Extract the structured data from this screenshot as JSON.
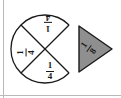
{
  "figure": {
    "background_color": "#ffffff",
    "stroke_color": "#1a1a1a",
    "rule_color": "#b9b9b9"
  },
  "circle": {
    "label": "partitioned circle",
    "center_x": 45,
    "center_y": 49,
    "radius": 34,
    "missing_sector": "right quarter",
    "sectors": [
      {
        "name": "top-sector",
        "numerator": "1",
        "denominator": "4",
        "rotation_deg": 180,
        "shaded": false
      },
      {
        "name": "left-sector",
        "numerator": "1",
        "denominator": "4",
        "rotation_deg": -90,
        "shaded": false
      },
      {
        "name": "bottom-sector",
        "numerator": "1",
        "denominator": "4",
        "rotation_deg": 0,
        "shaded": false
      }
    ]
  },
  "wedge": {
    "name": "shaded-eighth-wedge",
    "numerator": "1",
    "denominator": "8",
    "rotation_deg": -55,
    "shaded": true,
    "fill_color": "#8f8f8f",
    "stroke_color": "#1a1a1a"
  }
}
